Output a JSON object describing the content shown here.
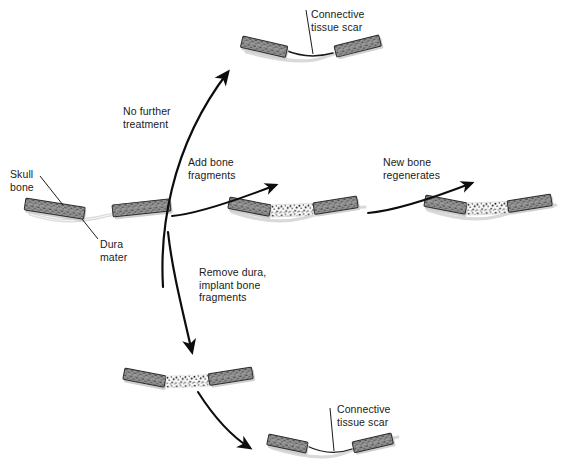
{
  "diagram": {
    "background": "#ffffff",
    "colors": {
      "bone_fill": "#9b9b9b",
      "bone_speckle": "#4a4a4a",
      "bone_border": "#2b2b2b",
      "fragment_fill": "#fbfbfb",
      "fragment_speckle": "#232323",
      "dura_line": "#d8d8d8",
      "scar_line": "#1a1a1a",
      "arrow": "#0d0d0d",
      "leader": "#1a1a1a",
      "text": "#1a1a1a",
      "shadow": "#cfcfcf"
    },
    "labels": {
      "skull_bone": "Skull\nbone",
      "dura_mater": "Dura\nmater",
      "no_further_treatment": "No further\ntreatment",
      "add_bone_fragments": "Add bone\nfragments",
      "new_bone_regenerates": "New bone\nregenerates",
      "remove_dura": "Remove dura,\nimplant bone\nfragments",
      "connective_tissue_scar_top": "Connective\ntissue scar",
      "connective_tissue_scar_bottom": "Connective\ntissue scar"
    },
    "nodes": [
      {
        "id": "start",
        "name": "skull-defect-start",
        "caption": "Skull bone with defect and intact dura mater",
        "has_dura": true,
        "segments": [
          "bone",
          "gap",
          "bone"
        ],
        "scar": false
      },
      {
        "id": "scar-top",
        "name": "connective-tissue-scar-result",
        "caption": "Defect heals with connective tissue scar",
        "has_dura": true,
        "segments": [
          "bone",
          "scar",
          "bone"
        ],
        "scar": true
      },
      {
        "id": "fragments-mid",
        "name": "bone-fragments-implanted-with-dura",
        "caption": "Bone fragments added over intact dura",
        "has_dura": true,
        "segments": [
          "bone",
          "fragments",
          "bone"
        ],
        "scar": false
      },
      {
        "id": "regenerated",
        "name": "regenerated-bone",
        "caption": "New bone regenerates across defect",
        "has_dura": true,
        "segments": [
          "bone",
          "fragments",
          "bone"
        ],
        "scar": false
      },
      {
        "id": "fragments-nodura",
        "name": "bone-fragments-implanted-no-dura",
        "caption": "Bone fragments implanted after dura removal",
        "has_dura": false,
        "segments": [
          "bone",
          "fragments",
          "bone"
        ],
        "scar": false
      },
      {
        "id": "scar-bottom",
        "name": "connective-tissue-scar-result-no-dura",
        "caption": "Defect heals with connective tissue scar",
        "has_dura": false,
        "segments": [
          "bone",
          "scar",
          "bone"
        ],
        "scar": true
      }
    ],
    "arrows": [
      {
        "id": "a1",
        "name": "arrow-no-further-treatment",
        "from": "start",
        "to": "scar-top",
        "label": "No further\ntreatment"
      },
      {
        "id": "a2",
        "name": "arrow-add-bone-fragments",
        "from": "start",
        "to": "fragments-mid",
        "label": "Add bone\nfragments"
      },
      {
        "id": "a3",
        "name": "arrow-new-bone-regenerates",
        "from": "fragments-mid",
        "to": "regenerated",
        "label": "New bone\nregenerates"
      },
      {
        "id": "a4",
        "name": "arrow-remove-dura",
        "from": "start",
        "to": "fragments-nodura",
        "label": "Remove dura,\nimplant bone\nfragments"
      },
      {
        "id": "a5",
        "name": "arrow-scar-forms",
        "from": "fragments-nodura",
        "to": "scar-bottom",
        "label": ""
      }
    ]
  }
}
